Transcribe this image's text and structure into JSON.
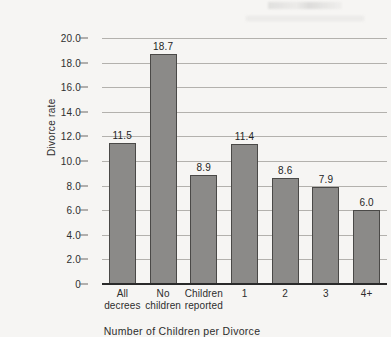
{
  "chart_data": {
    "type": "bar",
    "title": "",
    "subtitle": "",
    "xlabel": "Number of Children per Divorce",
    "ylabel": "Divorce rate",
    "categories": [
      "All decrees",
      "No children",
      "Children reported",
      "1",
      "2",
      "3",
      "4+"
    ],
    "category_lines": [
      [
        "All",
        "decrees"
      ],
      [
        "No",
        "children"
      ],
      [
        "Children",
        "reported"
      ],
      [
        "1"
      ],
      [
        "2"
      ],
      [
        "3"
      ],
      [
        "4+"
      ]
    ],
    "values": [
      11.5,
      18.7,
      8.9,
      11.4,
      8.6,
      7.9,
      6.0
    ],
    "value_labels": [
      "11.5",
      "18.7",
      "8.9",
      "11.4",
      "8.6",
      "7.9",
      "6.0"
    ],
    "ylim": [
      0,
      20
    ],
    "ytick_values": [
      0,
      2,
      4,
      6,
      8,
      10,
      12,
      14,
      16,
      18,
      20
    ],
    "ytick_labels": [
      "0",
      "2.0",
      "4.0",
      "6.0",
      "8.0",
      "10.0",
      "12.0",
      "14.0",
      "16.0",
      "18.0",
      "20.0"
    ],
    "grid": "horizontal",
    "legend": "none",
    "colors": {
      "bar_fill": "#8b8a88",
      "bar_stroke": "#4a4947",
      "gridline": "#b3b1ad",
      "axis": "#2a2a2a",
      "background": "#f6f5f3",
      "text": "#2d2d2d"
    }
  }
}
